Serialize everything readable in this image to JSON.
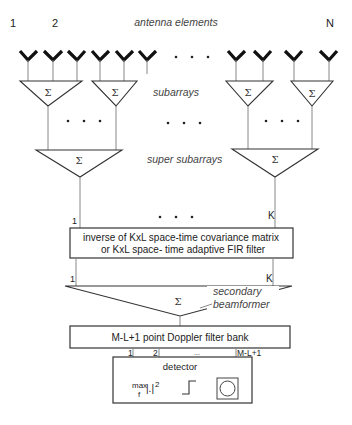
{
  "labels": {
    "antenna_elements": "antenna elements",
    "element_first": "1",
    "element_second": "2",
    "element_last": "N",
    "subarrays": "subarrays",
    "super_subarrays": "super subarrays",
    "channel_first": "1",
    "channel_last": "K",
    "filter_line1": "inverse of KxL space-time covariance matrix",
    "filter_line2": "or KxL space- time adaptive FIR filter",
    "out_first": "1",
    "out_last": "K",
    "secondary_line1": "secondary",
    "secondary_line2": "beamformer",
    "doppler": "M-L+1 point Doppler filter bank",
    "bin_1": "1",
    "bin_2": "2",
    "bin_dots": "...",
    "bin_last": "M-L+1",
    "detector": "detector",
    "max_text": "max",
    "max_sub": "f",
    "abs_sq": "|.|",
    "sq": "2",
    "sigma": "Σ",
    "ellipsis": "• • •"
  }
}
